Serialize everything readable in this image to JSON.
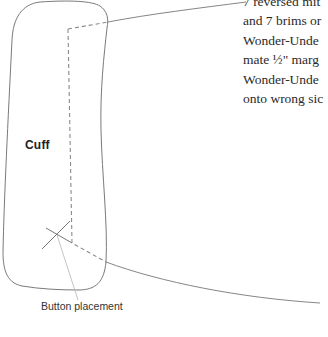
{
  "diagram": {
    "part_label": "Cuff",
    "callout_label": "Button placement",
    "colors": {
      "outline": "#777777",
      "dashed": "#8a8a8a",
      "leader": "#777777",
      "callout_leader": "#b0b0b0",
      "text": "#2a2a2a"
    }
  },
  "instructions": {
    "lines": [
      "7 reversed mit",
      "and 7 brims or",
      "Wonder-Unde",
      "mate ½\" marg",
      "Wonder-Unde",
      "onto wrong sic"
    ]
  }
}
